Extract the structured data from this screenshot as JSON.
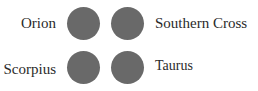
{
  "items": [
    {
      "label": "Orion",
      "side": "left",
      "row": 0
    },
    {
      "label": "Southern Cross",
      "side": "right",
      "row": 0
    },
    {
      "label": "Scorpius",
      "side": "left",
      "row": 1
    },
    {
      "label": "Taurus",
      "side": "right",
      "row": 1
    }
  ],
  "colors": {
    "dot": "#696969",
    "text": "#2a2a2a"
  }
}
